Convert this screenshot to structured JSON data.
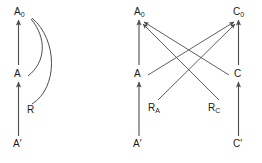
{
  "figure": {
    "type": "commutative-diagram-pair",
    "stroke_color": "#4d4d4d",
    "text_color": "#1a1a1a",
    "background": "#ffffff",
    "panels": [
      {
        "id": "left-panel",
        "name": "single-object-diagram",
        "nodes": [
          {
            "id": "A0",
            "base": "A",
            "subscript": "0",
            "prime": "",
            "x": 14,
            "y": 7,
            "label": "A0"
          },
          {
            "id": "A",
            "base": "A",
            "subscript": "",
            "prime": "",
            "x": 14,
            "y": 69,
            "label": "A"
          },
          {
            "id": "R",
            "base": "R",
            "subscript": "",
            "prime": "",
            "x": 27,
            "y": 105,
            "label": "R"
          },
          {
            "id": "Aprime",
            "base": "A",
            "subscript": "",
            "prime": "′",
            "x": 13,
            "y": 139,
            "label": "A′"
          }
        ],
        "edges": [
          {
            "from": "A",
            "to": "A0",
            "kind": "straight-arrow"
          },
          {
            "from": "Aprime",
            "to": "A",
            "kind": "straight-arrow"
          },
          {
            "from": "A",
            "to": "A0",
            "kind": "curved-arrow"
          },
          {
            "from": "R",
            "to": "A0",
            "kind": "curved-arrow"
          }
        ]
      },
      {
        "id": "right-panel",
        "name": "two-object-diagram",
        "nodes": [
          {
            "id": "A0",
            "base": "A",
            "subscript": "0",
            "prime": "",
            "x": 134,
            "y": 7,
            "label": "A0"
          },
          {
            "id": "C0",
            "base": "C",
            "subscript": "0",
            "prime": "",
            "x": 233,
            "y": 7,
            "label": "C0"
          },
          {
            "id": "A",
            "base": "A",
            "subscript": "",
            "prime": "",
            "x": 134,
            "y": 69,
            "label": "A"
          },
          {
            "id": "C",
            "base": "C",
            "subscript": "",
            "prime": "",
            "x": 234,
            "y": 69,
            "label": "C"
          },
          {
            "id": "RA",
            "base": "R",
            "subscript": "A",
            "prime": "",
            "x": 148,
            "y": 103,
            "label": "RA"
          },
          {
            "id": "RC",
            "base": "R",
            "subscript": "C",
            "prime": "",
            "x": 208,
            "y": 103,
            "label": "RC"
          },
          {
            "id": "Aprime",
            "base": "A",
            "subscript": "",
            "prime": "′",
            "x": 133,
            "y": 139,
            "label": "A′"
          },
          {
            "id": "Cprime",
            "base": "C",
            "subscript": "",
            "prime": "′",
            "x": 233,
            "y": 139,
            "label": "C′"
          }
        ],
        "edges": [
          {
            "from": "A",
            "to": "A0",
            "kind": "straight-arrow"
          },
          {
            "from": "Aprime",
            "to": "A",
            "kind": "straight-arrow"
          },
          {
            "from": "C",
            "to": "C0",
            "kind": "straight-arrow"
          },
          {
            "from": "Cprime",
            "to": "C",
            "kind": "straight-arrow"
          },
          {
            "from": "A",
            "to": "C0",
            "kind": "diagonal-arrow"
          },
          {
            "from": "C",
            "to": "A0",
            "kind": "diagonal-arrow"
          },
          {
            "from": "RA",
            "to": "C0",
            "kind": "diagonal-arrow"
          },
          {
            "from": "RC",
            "to": "A0",
            "kind": "diagonal-arrow"
          }
        ]
      }
    ]
  }
}
